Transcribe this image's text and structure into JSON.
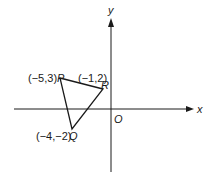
{
  "figure": {
    "type": "coordinate-plane-triangle",
    "axes": {
      "x_label": "x",
      "y_label": "y",
      "origin_label": "O"
    },
    "points": [
      {
        "name": "P",
        "coords": "(−5,3)",
        "x": -5,
        "y": 3
      },
      {
        "name": "Q",
        "coords": "(−4,−2)",
        "x": -4,
        "y": -2
      },
      {
        "name": "R",
        "coords": "(−1,2)",
        "x": -1,
        "y": 2
      }
    ],
    "colors": {
      "line": "#1a1a1a",
      "background": "#ffffff"
    }
  }
}
